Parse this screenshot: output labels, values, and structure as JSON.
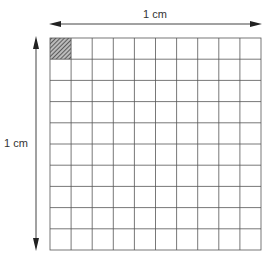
{
  "diagram": {
    "top_label": "1 cm",
    "left_label": "1 cm",
    "grid": {
      "rows": 10,
      "cols": 10,
      "shaded_cell": [
        0,
        0
      ]
    }
  }
}
